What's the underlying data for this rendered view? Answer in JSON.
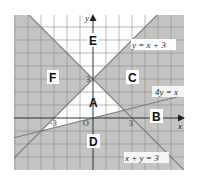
{
  "diagram": {
    "type": "inequality-regions-graph",
    "axes": {
      "x_label": "x",
      "y_label": "y",
      "origin_label": "O"
    },
    "ticks": {
      "y_three": "3",
      "x_three": "3",
      "x_neg_three": "-3"
    },
    "lines": [
      {
        "id": "line1",
        "equation": "y = x + 3"
      },
      {
        "id": "line2",
        "equation": "4y = x"
      },
      {
        "id": "line3",
        "equation": "x + y = 3"
      }
    ],
    "regions": [
      {
        "label": "E",
        "shaded": false
      },
      {
        "label": "F",
        "shaded": true
      },
      {
        "label": "C",
        "shaded": true
      },
      {
        "label": "A",
        "shaded": false
      },
      {
        "label": "B",
        "shaded": true
      },
      {
        "label": "D",
        "shaded": true
      }
    ],
    "colors": {
      "shaded": "#c4c4c4",
      "unshaded": "#ffffff",
      "grid": "#8a8a8a",
      "line": "#777777",
      "axis": "#333333"
    }
  }
}
